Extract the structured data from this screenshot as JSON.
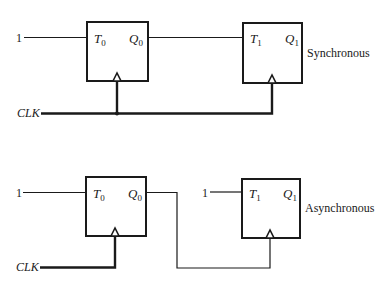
{
  "diagram": {
    "type": "T flip-flop counter configurations",
    "synchronous": {
      "label": "Synchronous",
      "input_label": "1",
      "clock_label": "CLK",
      "ff0": {
        "input": "T",
        "input_sub": "0",
        "output": "Q",
        "output_sub": "0"
      },
      "ff1": {
        "input": "T",
        "input_sub": "1",
        "output": "Q",
        "output_sub": "1"
      },
      "connections": [
        "1 -> T0",
        "Q0 -> T1",
        "CLK -> FF0 clock",
        "CLK -> FF1 clock"
      ]
    },
    "asynchronous": {
      "label": "Asynchronous",
      "input_label_0": "1",
      "input_label_1": "1",
      "clock_label": "CLK",
      "ff0": {
        "input": "T",
        "input_sub": "0",
        "output": "Q",
        "output_sub": "0"
      },
      "ff1": {
        "input": "T",
        "input_sub": "1",
        "output": "Q",
        "output_sub": "1"
      },
      "connections": [
        "1 -> T0",
        "1 -> T1",
        "CLK -> FF0 clock",
        "Q0 -> FF1 clock"
      ]
    }
  }
}
